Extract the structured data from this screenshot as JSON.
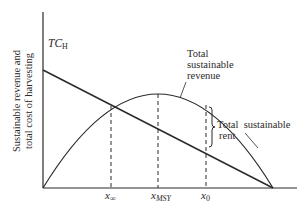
{
  "diagram": {
    "y_axis_label_line1": "Sustainable revenue and",
    "y_axis_label_line2": "total cost of harvesting",
    "tc_label_main": "TC",
    "tc_label_sub": "H",
    "revenue_label_line1": "Total",
    "revenue_label_line2": "sustainable",
    "revenue_label_line3": "revenue",
    "rent_label_line1": "Total  sustainable",
    "rent_label_line2": "rent",
    "x_ticks": [
      {
        "main": "x",
        "sub": "∞"
      },
      {
        "main": "x",
        "sub": "MSY"
      },
      {
        "main": "x",
        "sub": "0"
      }
    ],
    "colors": {
      "line": "#2a2a2a",
      "background": "#ffffff"
    }
  }
}
